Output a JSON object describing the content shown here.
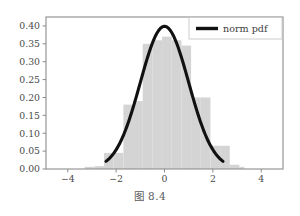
{
  "figure": {
    "caption": "图 8.4",
    "background_color": "#ffffff",
    "axes_color": "#8c8c8c",
    "bar_color": "#d4d4d4",
    "curve_color": "#111111"
  },
  "legend": {
    "position": "upper-right",
    "entries": [
      {
        "label": "norm pdf",
        "color": "#111111",
        "type": "line"
      }
    ]
  },
  "chart_data": {
    "type": "bar",
    "title": "",
    "xlabel": "",
    "ylabel": "",
    "xlim": [
      -4.9,
      4.9
    ],
    "ylim": [
      0.0,
      0.425
    ],
    "xticks": [
      -4,
      -2,
      0,
      2,
      4
    ],
    "xtick_labels": [
      "−4",
      "−2",
      "0",
      "2",
      "4"
    ],
    "yticks": [
      0.0,
      0.05,
      0.1,
      0.15,
      0.2,
      0.25,
      0.3,
      0.35,
      0.4
    ],
    "ytick_labels": [
      "0.00",
      "0.05",
      "0.10",
      "0.15",
      "0.20",
      "0.25",
      "0.30",
      "0.35",
      "0.40"
    ],
    "grid": false,
    "bar_edges": [
      -3.3,
      -2.9,
      -2.5,
      -2.1,
      -1.7,
      -1.3,
      -0.9,
      -0.5,
      -0.1,
      0.3,
      0.7,
      1.1,
      1.5,
      1.9,
      2.3,
      2.7,
      3.1,
      3.3
    ],
    "values": [
      0.006,
      0.008,
      0.045,
      0.045,
      0.18,
      0.19,
      0.35,
      0.36,
      0.37,
      0.36,
      0.345,
      0.2,
      0.2,
      0.065,
      0.065,
      0.012,
      0.006
    ],
    "series": [
      {
        "name": "norm pdf",
        "type": "line",
        "mu": 0,
        "sigma": 1,
        "peak": 0.399,
        "x_range": [
          -2.42,
          2.42
        ],
        "x": [
          -2.4,
          -2.0,
          -1.6,
          -1.2,
          -0.8,
          -0.4,
          0.0,
          0.4,
          0.8,
          1.2,
          1.6,
          2.0,
          2.4
        ],
        "y": [
          0.0224,
          0.054,
          0.1109,
          0.1942,
          0.2897,
          0.3683,
          0.3989,
          0.3683,
          0.2897,
          0.1942,
          0.1109,
          0.054,
          0.0224
        ]
      }
    ]
  }
}
